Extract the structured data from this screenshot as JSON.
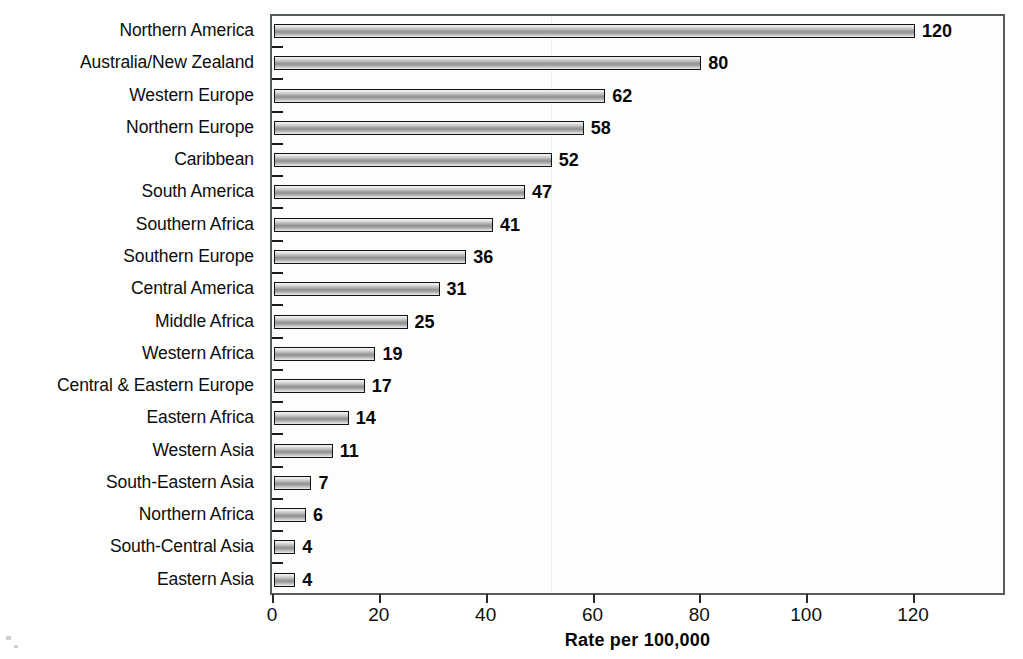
{
  "chart_data": {
    "type": "bar",
    "orientation": "horizontal",
    "title": "",
    "subtitle": "",
    "xlabel": "Rate per 100,000",
    "ylabel": "",
    "xlim": [
      0,
      136
    ],
    "xticks": [
      0,
      20,
      40,
      60,
      80,
      100,
      120
    ],
    "xticklabels": [
      "0",
      "20",
      "40",
      "60",
      "80",
      "100",
      "120"
    ],
    "grid": false,
    "legend": null,
    "categories": [
      "Northern America",
      "Australia/New Zealand",
      "Western Europe",
      "Northern Europe",
      "Caribbean",
      "South America",
      "Southern Africa",
      "Southern Europe",
      "Central America",
      "Middle Africa",
      "Western Africa",
      "Central & Eastern Europe",
      "Eastern Africa",
      "Western Asia",
      "South-Eastern Asia",
      "Northern Africa",
      "South-Central Asia",
      "Eastern Asia"
    ],
    "values": [
      120,
      80,
      62,
      58,
      52,
      47,
      41,
      36,
      31,
      25,
      19,
      17,
      14,
      11,
      7,
      6,
      4,
      4
    ],
    "data_labels": [
      "120",
      "80",
      "62",
      "58",
      "52",
      "47",
      "41",
      "36",
      "31",
      "25",
      "19",
      "17",
      "14",
      "11",
      "7",
      "6",
      "4",
      "4"
    ],
    "colors": {
      "bar_fill_light": "#f0f0f0",
      "bar_fill_mid": "#8f8f8f",
      "bar_border": "#121212",
      "axis": "#555c5c",
      "text": "#0d0d0d",
      "background": "#ffffff"
    }
  }
}
